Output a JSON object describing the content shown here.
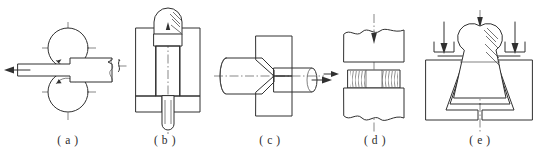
{
  "figure": {
    "panel_count": 5,
    "line_color": "#303030",
    "hatch_color": "#3a3a3a",
    "centerline_color": "#555555",
    "background_color": "#ffffff"
  },
  "panels": [
    {
      "key": "a",
      "caption": "( a )",
      "process": "rolling",
      "description": "Workpiece passes between two counter-rotating rolls and is reduced in thickness",
      "elements": {
        "upper_roll": "circle with centerlines and rotation arrow",
        "lower_roll": "circle with centerlines and rotation arrow",
        "workpiece": "flat strip entering thick from right, exiting thin to left",
        "flow_arrow": "left-pointing arrow showing exit direction"
      }
    },
    {
      "key": "b",
      "caption": "( b )",
      "process": "forward-extrusion",
      "description": "Punch presses billet in a hatched container so material is extruded downward through the die orifice",
      "elements": {
        "punch": "rounded punch at top with section hatching",
        "container": "hatched die block on both sides",
        "billet": "vertically striated billet in the chamber",
        "extrudate": "slender rod exiting at the bottom",
        "axis": "vertical dash-dot centerline"
      }
    },
    {
      "key": "c",
      "caption": "( c )",
      "process": "drawing",
      "description": "Bar is pulled through a tapered die opening, reducing its cross-section",
      "elements": {
        "die": "hatched die block with conical approach",
        "incoming_bar": "large diameter bar on the left",
        "drawn_bar": "reduced diameter bar on the right",
        "axis": "horizontal dash-dot centerline",
        "pull_arrow": "right-pointing arrow showing draw direction"
      }
    },
    {
      "key": "d",
      "caption": "( d )",
      "process": "upsetting",
      "description": "Cylindrical billet compressed between flat upper and lower dies, barrelling at the sides",
      "elements": {
        "upper_die": "flat anvil with broken top edge",
        "lower_die": "flat anvil with broken bottom edge",
        "workpiece": "short billet with textured barrelled flanks",
        "axis": "vertical dash-dot centerline",
        "load_arrow": "downward arrow indicating press force"
      }
    },
    {
      "key": "e",
      "caption": "( e )",
      "process": "die-forging",
      "description": "Billet forced into a tapered impression die cavity by vertical forging load",
      "elements": {
        "die_block": "hatched die with V-shaped cavity",
        "workpiece": "forged part filling the cavity",
        "axis": "vertical dash-dot centerline",
        "center_arrow": "downward arrow on the axis",
        "side_arrows": "two angled downward arrows at the die faces"
      }
    }
  ]
}
